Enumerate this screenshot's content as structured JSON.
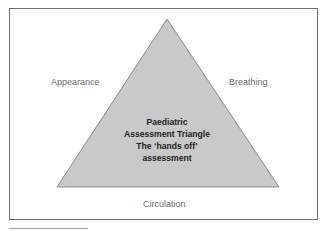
{
  "diagram": {
    "type": "triangle",
    "colors": {
      "frame_border": "#6e6e6e",
      "triangle_fill": "#c9c9c9",
      "triangle_stroke": "#8a8a8a",
      "side_label_color": "#6a6a6a",
      "center_text_color": "#1e1e1e"
    },
    "side_labels": {
      "left": "Appearance",
      "right": "Breathing",
      "bottom": "Circulation"
    },
    "center_title": {
      "line1": "Paediatric",
      "line2": "Assessment Triangle",
      "line3": "The ‘hands off’",
      "line4": "assessment"
    }
  }
}
